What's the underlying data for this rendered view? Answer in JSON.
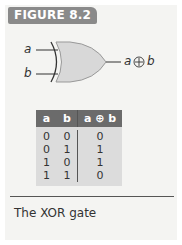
{
  "figure": {
    "label": "FIGURE 8.2",
    "caption": "The XOR gate"
  },
  "gate": {
    "type": "XOR",
    "input_a": "a",
    "input_b": "b",
    "output": "a ⊕ b",
    "output_a": "a",
    "output_op": "⊕",
    "output_b": "b"
  },
  "truth_table": {
    "headers": [
      "a",
      "b",
      "a ⊕ b"
    ],
    "rows": [
      [
        "0",
        "0",
        "0"
      ],
      [
        "0",
        "1",
        "1"
      ],
      [
        "1",
        "0",
        "1"
      ],
      [
        "1",
        "1",
        "0"
      ]
    ]
  },
  "colors": {
    "label_bg": "#8a8a8a",
    "header_bg": "#6b6b6b",
    "table_bg": "#dcdcdc",
    "gate_fill": "#d8d8d8"
  }
}
